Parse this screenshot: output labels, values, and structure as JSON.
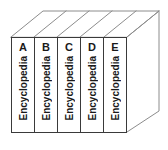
{
  "scene": {
    "title": "Encyclopedia volume set",
    "description": "Five upright encyclopedia volumes shown in 3D isometric-style line drawing",
    "background_color": "#ffffff",
    "line_color": "#3a3a3a",
    "depth_line_color": "#8c8c8c",
    "text_color": "#1a1a1a",
    "volume_count": 5
  },
  "books": [
    {
      "letter": "A",
      "title": "Encyclopedia"
    },
    {
      "letter": "B",
      "title": "Encyclopedia"
    },
    {
      "letter": "C",
      "title": "Encyclopedia"
    },
    {
      "letter": "D",
      "title": "Encyclopedia"
    },
    {
      "letter": "E",
      "title": "Encyclopedia"
    }
  ]
}
